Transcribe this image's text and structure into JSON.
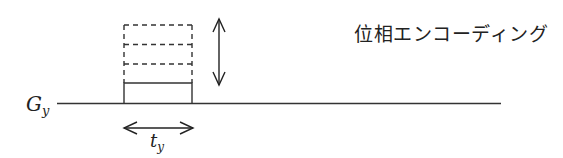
{
  "diagram": {
    "type": "pulse-sequence",
    "axis_label": {
      "main": "G",
      "sub": "y"
    },
    "duration_label": {
      "main": "t",
      "sub": "y"
    },
    "title": "位相エンコーディング",
    "line_color": "#333333",
    "phase_steps": 4
  }
}
